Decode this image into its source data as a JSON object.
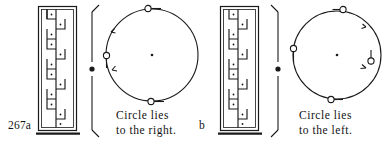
{
  "figure": {
    "number_label": "267a",
    "second_label": "b",
    "ink_color": "#1a1a1a",
    "paper_color": "#ffffff"
  },
  "panels": [
    {
      "id": "panel-a",
      "label": "267a",
      "caption_line1": "Circle lies",
      "caption_line2": "to the right.",
      "staircase": {
        "steps": 6,
        "dots_per_step": 1,
        "direction": "descending-right"
      },
      "axis": {
        "orientation": "vertical",
        "top_arrow": "up-right",
        "bottom_arrow": "down-right",
        "center_marker": "filled-dot"
      },
      "circle": {
        "center_marker": "dot",
        "markers": [
          "top",
          "left",
          "bottom"
        ],
        "arrow_positions": [
          "upper-left",
          "lower-left"
        ],
        "rotation_sense": "left-side"
      }
    },
    {
      "id": "panel-b",
      "label": "b",
      "caption_line1": "Circle lies",
      "caption_line2": "to the left.",
      "staircase": {
        "steps": 6,
        "dots_per_step": 1,
        "direction": "descending-right"
      },
      "axis": {
        "orientation": "vertical",
        "top_arrow": "up-left",
        "bottom_arrow": "down-left",
        "center_marker": "filled-dot"
      },
      "circle": {
        "center_marker": "dot",
        "markers": [
          "top",
          "left",
          "bottom",
          "right"
        ],
        "arrow_positions": [
          "upper-right",
          "lower-right"
        ],
        "rotation_sense": "right-side"
      }
    }
  ]
}
